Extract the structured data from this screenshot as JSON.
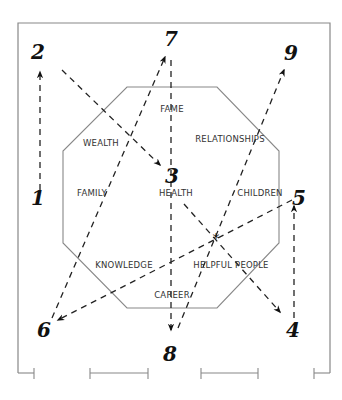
{
  "diagram": {
    "type": "bagua-flying-star-path",
    "frame": {
      "x": 18,
      "y": 23,
      "width": 312,
      "height": 352,
      "color": "#888888"
    },
    "octagon": {
      "points": [
        [
          127,
          87
        ],
        [
          217,
          87
        ],
        [
          279,
          151
        ],
        [
          279,
          243
        ],
        [
          217,
          308
        ],
        [
          127,
          308
        ],
        [
          63,
          243
        ],
        [
          63,
          151
        ]
      ],
      "color": "#888888"
    },
    "areas": [
      {
        "label": "FAME",
        "x": 172,
        "y": 112
      },
      {
        "label": "WEALTH",
        "x": 101,
        "y": 146
      },
      {
        "label": "RELATIONSHIPS",
        "x": 230,
        "y": 142
      },
      {
        "label": "FAMILY",
        "x": 92,
        "y": 196
      },
      {
        "label": "HEALTH",
        "x": 176,
        "y": 196
      },
      {
        "label": "CHILDREN",
        "x": 260,
        "y": 196
      },
      {
        "label": "KNOWLEDGE",
        "x": 124,
        "y": 268
      },
      {
        "label": "HELPFUL PEOPLE",
        "x": 231,
        "y": 268
      },
      {
        "label": "CAREER",
        "x": 172,
        "y": 298
      }
    ],
    "numbers": [
      {
        "label": "1",
        "x": 38,
        "y": 205
      },
      {
        "label": "2",
        "x": 38,
        "y": 59
      },
      {
        "label": "3",
        "x": 172,
        "y": 183
      },
      {
        "label": "4",
        "x": 293,
        "y": 337
      },
      {
        "label": "5",
        "x": 299,
        "y": 205
      },
      {
        "label": "6",
        "x": 44,
        "y": 337
      },
      {
        "label": "7",
        "x": 171,
        "y": 46
      },
      {
        "label": "8",
        "x": 170,
        "y": 361
      },
      {
        "label": "9",
        "x": 291,
        "y": 60
      }
    ],
    "paths": [
      {
        "from": "1",
        "to": "2",
        "x1": 40,
        "y1": 190,
        "x2": 40,
        "y2": 72
      },
      {
        "from": "2",
        "to": "3",
        "x1": 62,
        "y1": 70,
        "x2": 160,
        "y2": 165
      },
      {
        "from": "3",
        "to": "4",
        "x1": 184,
        "y1": 204,
        "x2": 280,
        "y2": 312
      },
      {
        "from": "4",
        "to": "5",
        "x1": 294,
        "y1": 318,
        "x2": 294,
        "y2": 206
      },
      {
        "from": "5",
        "to": "6",
        "x1": 292,
        "y1": 200,
        "x2": 58,
        "y2": 320
      },
      {
        "from": "6",
        "to": "7",
        "x1": 52,
        "y1": 318,
        "x2": 165,
        "y2": 57
      },
      {
        "from": "7",
        "to": "8",
        "x1": 171,
        "y1": 60,
        "x2": 171,
        "y2": 330
      },
      {
        "from": "8",
        "to": "9",
        "x1": 178,
        "y1": 328,
        "x2": 284,
        "y2": 70
      }
    ],
    "center_marker": {
      "symbol": "*",
      "x": 216,
      "y": 238
    },
    "scale_marks": [
      {
        "x1": 18,
        "x2": 34,
        "y": 373,
        "ticks": [
          34
        ]
      },
      {
        "x1": 90,
        "x2": 148,
        "y": 373,
        "ticks": [
          90,
          148
        ]
      },
      {
        "x1": 201,
        "x2": 258,
        "y": 373,
        "ticks": [
          201,
          258
        ]
      },
      {
        "x1": 314,
        "x2": 330,
        "y": 373,
        "ticks": [
          314
        ]
      }
    ]
  }
}
